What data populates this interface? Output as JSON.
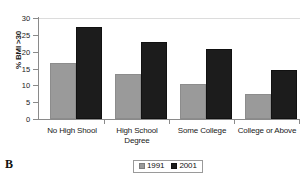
{
  "panel": {
    "letter": "B"
  },
  "chart_data": {
    "type": "bar",
    "title": "",
    "xlabel": "",
    "ylabel": "% BMI >30",
    "ylim": [
      0,
      30
    ],
    "yticks": [
      0,
      5,
      10,
      15,
      20,
      25,
      30
    ],
    "ytick_labels": [
      "0",
      "5",
      "10",
      "15",
      "20",
      "25",
      "30"
    ],
    "grid": "top-gridline-only",
    "legend_position": "bottom-center",
    "categories": [
      "No High Shool",
      "High School Degree",
      "Some College",
      "College or Above"
    ],
    "category_lines": [
      [
        "No High Shool"
      ],
      [
        "High School",
        "Degree"
      ],
      [
        "Some College"
      ],
      [
        "College or Above"
      ]
    ],
    "series": [
      {
        "name": "1991",
        "color": "#9a9a9a",
        "values": [
          16.5,
          13.4,
          10.4,
          7.5
        ]
      },
      {
        "name": "2001",
        "color": "#1c1c1c",
        "values": [
          27.3,
          22.9,
          20.8,
          14.6
        ]
      }
    ],
    "colors": {
      "series_1991": "#9a9a9a",
      "series_2001": "#1c1c1c",
      "axis": "#8a8a8a",
      "gridline": "#dcdcdc",
      "background": "#ffffff"
    }
  },
  "legend": {
    "entries": [
      {
        "label": "1991"
      },
      {
        "label": "2001"
      }
    ]
  }
}
